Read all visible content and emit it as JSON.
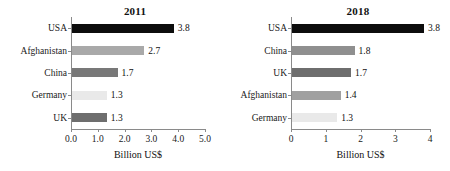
{
  "chart_data": [
    {
      "type": "bar",
      "title": "2011",
      "orientation": "horizontal",
      "categories": [
        "USA",
        "Afghanistan",
        "China",
        "Germany",
        "UK"
      ],
      "values": [
        3.8,
        2.7,
        1.7,
        1.3,
        1.3
      ],
      "value_labels": [
        "3.8",
        "2.7",
        "1.7",
        "1.3",
        "1.3"
      ],
      "bar_colors": [
        "#0d0d0d",
        "#a9a9a9",
        "#787878",
        "#e9e9e9",
        "#6e6e6e"
      ],
      "xlabel": "Billion US$",
      "ylabel": "",
      "xlim": [
        0.0,
        5.0
      ],
      "xticks": [
        0.0,
        1.0,
        2.0,
        3.0,
        4.0,
        5.0
      ],
      "xtick_labels": [
        "0.0",
        "1.0",
        "2.0",
        "3.0",
        "4.0",
        "5.0"
      ],
      "grid": false,
      "legend": "none"
    },
    {
      "type": "bar",
      "title": "2018",
      "orientation": "horizontal",
      "categories": [
        "USA",
        "China",
        "UK",
        "Afghanistan",
        "Germany"
      ],
      "values": [
        3.8,
        1.8,
        1.7,
        1.4,
        1.3
      ],
      "value_labels": [
        "3.8",
        "1.8",
        "1.7",
        "1.4",
        "1.3"
      ],
      "bar_colors": [
        "#0d0d0d",
        "#8f8f8f",
        "#6e6e6e",
        "#a0a0a0",
        "#e9e9e9"
      ],
      "xlabel": "Billion US$",
      "ylabel": "",
      "xlim": [
        0,
        4
      ],
      "xticks": [
        0,
        1,
        2,
        3,
        4
      ],
      "xtick_labels": [
        "0",
        "1",
        "2",
        "3",
        "4"
      ],
      "grid": false,
      "legend": "none"
    }
  ],
  "colors": {
    "axis": "#8a8a8a",
    "text": "#111111",
    "background": "#ffffff"
  }
}
